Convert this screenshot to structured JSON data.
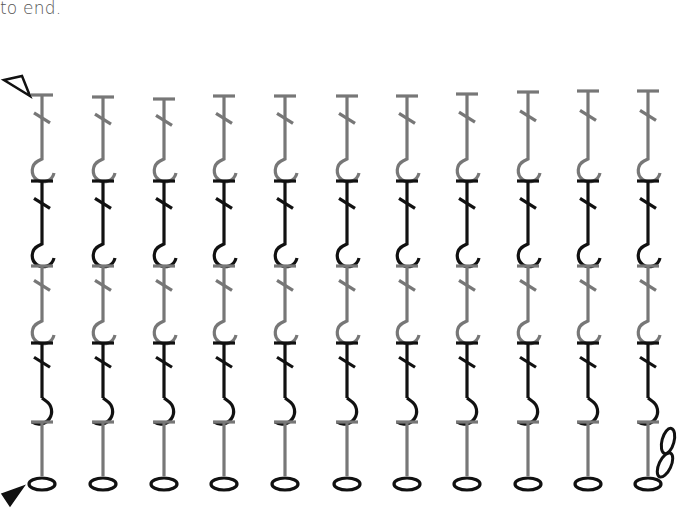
{
  "caption": {
    "text": "to end."
  },
  "chart": {
    "colors": {
      "gray": "#777777",
      "black": "#111111",
      "background": "#ffffff"
    },
    "markers": {
      "start_row_marker": {
        "type": "filled-triangle",
        "y": 492
      },
      "end_row_marker": {
        "type": "outline-triangle",
        "y": 84
      }
    },
    "columns": [
      {
        "x": 42,
        "top": 95
      },
      {
        "x": 103,
        "top": 97
      },
      {
        "x": 164,
        "top": 99
      },
      {
        "x": 224,
        "top": 96
      },
      {
        "x": 285,
        "top": 96
      },
      {
        "x": 347,
        "top": 96
      },
      {
        "x": 407,
        "top": 96
      },
      {
        "x": 467,
        "top": 94
      },
      {
        "x": 528,
        "top": 92
      },
      {
        "x": 588,
        "top": 91
      },
      {
        "x": 648,
        "top": 91
      }
    ],
    "rows": [
      {
        "row": 1,
        "symbol": "chain",
        "count": 11,
        "color": "black"
      },
      {
        "row": 2,
        "symbol": "treble-post-stitch",
        "hook": "right",
        "color": "black",
        "base": "gray"
      },
      {
        "row": 3,
        "symbol": "treble-post-stitch",
        "hook": "left",
        "color": "gray",
        "base": "black"
      },
      {
        "row": 4,
        "symbol": "treble-post-stitch",
        "hook": "left",
        "color": "black",
        "base": "gray"
      },
      {
        "row": 5,
        "symbol": "treble-post-stitch",
        "hook": "left",
        "color": "gray",
        "base": "black"
      }
    ],
    "turning_chain": {
      "count": 3,
      "column": 11
    }
  }
}
